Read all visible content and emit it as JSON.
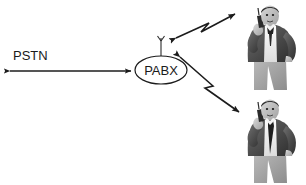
{
  "diagram": {
    "background_color": "#ffffff",
    "line_color": "#1c1c1c",
    "text_color": "#1a1a1a",
    "nodes": [
      {
        "id": "pabx",
        "label": "PABX",
        "shape": "ellipse",
        "cx": 161,
        "cy": 70,
        "rx": 26,
        "ry": 14,
        "has_antenna": true
      }
    ],
    "labels": [
      {
        "id": "pstn",
        "text": "PSTN",
        "x": 13,
        "y": 60
      }
    ],
    "links": [
      {
        "id": "pstn-link",
        "from": "pstn-cloud",
        "to": "pabx",
        "style": "straight",
        "arrows": "both"
      },
      {
        "id": "pabx-user-upper",
        "from": "pabx",
        "to": "mobile-user-upper",
        "style": "zigzag",
        "arrows": "both"
      },
      {
        "id": "pabx-user-lower",
        "from": "pabx",
        "to": "mobile-user-lower",
        "style": "zigzag",
        "arrows": "both"
      }
    ],
    "people": [
      {
        "id": "mobile-user-upper",
        "name": "mobile-user-upper",
        "description": "man in suit holding mobile phone, hand on hip",
        "x": 233,
        "y": 4,
        "width": 70,
        "height": 88
      },
      {
        "id": "mobile-user-lower",
        "name": "mobile-user-lower",
        "description": "man in suit holding mobile phone, hand on hip",
        "x": 233,
        "y": 100,
        "width": 70,
        "height": 85
      }
    ]
  }
}
